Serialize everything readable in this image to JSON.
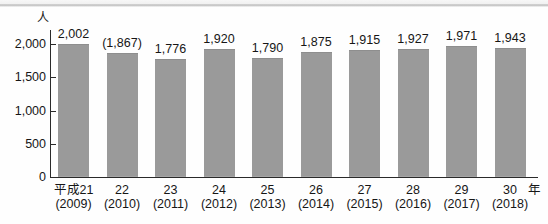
{
  "figure": {
    "background_color": "#fefefe",
    "bar_color": "#9a9a9a",
    "axis_color": "#2a2a2a",
    "text_color": "#161616"
  },
  "chart_data": {
    "type": "bar",
    "title": "",
    "subtitle": "",
    "xlabel": "",
    "ylabel": "人",
    "unit_label": "人",
    "x_axis_suffix": "年",
    "ylim": [
      0,
      2000
    ],
    "ytick_values": [
      0,
      500,
      1000,
      1500,
      2000
    ],
    "ytick_labels": [
      "0",
      "500",
      "1,000",
      "1,500",
      "2,000"
    ],
    "grid": false,
    "legend": null,
    "categories": [
      "平成21",
      "22",
      "23",
      "24",
      "25",
      "26",
      "27",
      "28",
      "29",
      "30"
    ],
    "category_sub_labels": [
      "(2009)",
      "(2010)",
      "(2011)",
      "(2012)",
      "(2013)",
      "(2014)",
      "(2015)",
      "(2016)",
      "(2017)",
      "(2018)"
    ],
    "values": [
      2002,
      1867,
      1776,
      1920,
      1790,
      1875,
      1915,
      1927,
      1971,
      1943
    ],
    "value_labels": [
      "2,002",
      "(1,867)",
      "1,776",
      "1,920",
      "1,790",
      "1,875",
      "1,915",
      "1,927",
      "1,971",
      "1,943"
    ],
    "bars": [
      {
        "category": "平成21",
        "sub_label": "(2009)",
        "value": 2002,
        "value_label": "2,002"
      },
      {
        "category": "22",
        "sub_label": "(2010)",
        "value": 1867,
        "value_label": "(1,867)"
      },
      {
        "category": "23",
        "sub_label": "(2011)",
        "value": 1776,
        "value_label": "1,776"
      },
      {
        "category": "24",
        "sub_label": "(2012)",
        "value": 1920,
        "value_label": "1,920"
      },
      {
        "category": "25",
        "sub_label": "(2013)",
        "value": 1790,
        "value_label": "1,790"
      },
      {
        "category": "26",
        "sub_label": "(2014)",
        "value": 1875,
        "value_label": "1,875"
      },
      {
        "category": "27",
        "sub_label": "(2015)",
        "value": 1915,
        "value_label": "1,915"
      },
      {
        "category": "28",
        "sub_label": "(2016)",
        "value": 1927,
        "value_label": "1,927"
      },
      {
        "category": "29",
        "sub_label": "(2017)",
        "value": 1971,
        "value_label": "1,971"
      },
      {
        "category": "30",
        "sub_label": "(2018)",
        "value": 1943,
        "value_label": "1,943"
      }
    ]
  }
}
